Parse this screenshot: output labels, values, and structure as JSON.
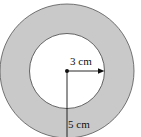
{
  "diagram": {
    "type": "annulus",
    "colors": {
      "ring_fill": "#c9c9c9",
      "inner_fill": "#ffffff",
      "stroke": "#555555",
      "line": "#111111"
    },
    "inner_radius_label": "3 cm",
    "outer_radius_label": "5 cm"
  }
}
